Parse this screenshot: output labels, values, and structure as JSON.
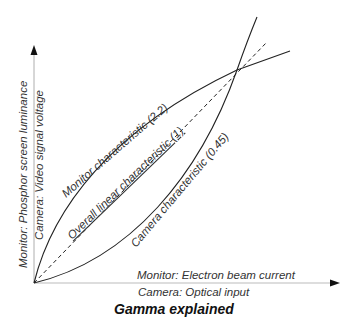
{
  "title": "Gamma explained",
  "axes": {
    "y_label_monitor": "Monitor: Phosphor screen luminance",
    "y_label_camera": "Camera: Video signal voltage",
    "x_label_monitor": "Monitor: Electron beam current",
    "x_label_camera": "Camera: Optical input"
  },
  "curves": {
    "monitor": "Monitor characteristic (2.2)",
    "linear": "Overall linear characteristic (1)",
    "camera": "Camera characteristic (0.45)"
  },
  "colors": {
    "line": "#222222",
    "axis": "#aaaaaa",
    "text": "#333333"
  }
}
